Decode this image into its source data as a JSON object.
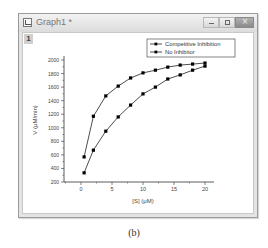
{
  "window": {
    "title": "Graph1 *",
    "layer_tab": "1",
    "buttons": [
      "minimize",
      "maximize",
      "close"
    ]
  },
  "caption": "(b)",
  "colors": {
    "series": "#000000",
    "axis": "#333333",
    "titlebar": "#e0e0e0"
  },
  "chart_data": {
    "type": "line",
    "title": "",
    "xlabel": "[S] (μM)",
    "ylabel": "V (μM/min)",
    "xlim": [
      -3,
      22
    ],
    "ylim": [
      200,
      2000
    ],
    "xticks": [
      0,
      5,
      10,
      15,
      20
    ],
    "yticks": [
      200,
      400,
      600,
      800,
      1000,
      1200,
      1400,
      1600,
      1800,
      2000
    ],
    "grid": false,
    "legend_position": "top-right",
    "x": [
      0.5,
      2,
      4,
      6,
      8,
      10,
      12,
      14,
      16,
      18,
      20
    ],
    "series": [
      {
        "name": "Competitive Inhibition",
        "marker": "square",
        "values": [
          570,
          1170,
          1470,
          1615,
          1735,
          1810,
          1850,
          1895,
          1925,
          1940,
          1955
        ]
      },
      {
        "name": "No Inhibitor",
        "marker": "square",
        "values": [
          335,
          670,
          950,
          1160,
          1335,
          1500,
          1600,
          1720,
          1780,
          1850,
          1910
        ]
      }
    ]
  }
}
